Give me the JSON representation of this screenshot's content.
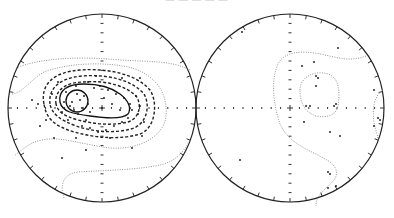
{
  "figure": {
    "caption_fragment": "— — — — —",
    "panels": [
      {
        "id": "left",
        "type": "equal-area stereonet",
        "center": [
          102,
          108
        ],
        "radius": 94,
        "contours": [
          {
            "style": "solid",
            "level": "highest"
          },
          {
            "style": "solid",
            "level": "high"
          },
          {
            "style": "dashed",
            "level": "mid-high"
          },
          {
            "style": "dashed",
            "level": "mid"
          },
          {
            "style": "dashed",
            "level": "mid-low"
          },
          {
            "style": "dotted",
            "level": "low"
          },
          {
            "style": "dotted",
            "level": "lowest"
          }
        ],
        "maximum_near": [
          77,
          101
        ]
      },
      {
        "id": "right",
        "type": "equal-area stereonet",
        "center": [
          290,
          108
        ],
        "radius": 94,
        "contours": [
          {
            "style": "dotted",
            "level": "low"
          },
          {
            "style": "dotted",
            "level": "lowest"
          }
        ],
        "maximum_near": [
          328,
          104
        ]
      }
    ]
  },
  "chart_data": [
    {
      "type": "scatter",
      "title": "",
      "subtype": "stereonet pole plot with density contours",
      "xlabel": "",
      "ylabel": "",
      "grid": false,
      "points_relative_to_center": [
        [
          -25,
          -14
        ],
        [
          -22,
          -8
        ],
        [
          -18,
          -12
        ],
        [
          -30,
          -6
        ],
        [
          -28,
          2
        ],
        [
          -20,
          0
        ],
        [
          -24,
          6
        ],
        [
          -14,
          -4
        ],
        [
          -12,
          4
        ],
        [
          -32,
          -2
        ],
        [
          -8,
          -20
        ],
        [
          -2,
          -22
        ],
        [
          6,
          -18
        ],
        [
          14,
          -14
        ],
        [
          22,
          -10
        ],
        [
          28,
          -4
        ],
        [
          30,
          2
        ],
        [
          26,
          10
        ],
        [
          20,
          14
        ],
        [
          12,
          18
        ],
        [
          4,
          22
        ],
        [
          -4,
          24
        ],
        [
          -12,
          20
        ],
        [
          -20,
          18
        ],
        [
          -34,
          12
        ],
        [
          -38,
          -6
        ],
        [
          -40,
          4
        ],
        [
          -36,
          -16
        ],
        [
          -26,
          -22
        ],
        [
          -14,
          -26
        ],
        [
          0,
          0
        ],
        [
          2,
          -10
        ],
        [
          10,
          -4
        ],
        [
          18,
          2
        ],
        [
          34,
          -12
        ],
        [
          36,
          6
        ],
        [
          38,
          -2
        ],
        [
          -50,
          -14
        ],
        [
          -64,
          -4
        ],
        [
          -56,
          12
        ],
        [
          -70,
          -8
        ],
        [
          -48,
          30
        ],
        [
          -16,
          42
        ],
        [
          -40,
          50
        ],
        [
          -26,
          30
        ],
        [
          40,
          28
        ],
        [
          30,
          40
        ],
        [
          38,
          -30
        ],
        [
          20,
          -30
        ],
        [
          -6,
          -32
        ],
        [
          -16,
          12
        ],
        [
          8,
          30
        ],
        [
          42,
          14
        ],
        [
          -44,
          -26
        ],
        [
          -62,
          18
        ]
      ],
      "right_points_relative_to_center": [
        [
          -48,
          -76
        ],
        [
          24,
          -46
        ],
        [
          48,
          -60
        ],
        [
          12,
          -42
        ],
        [
          26,
          -32
        ],
        [
          28,
          -30
        ],
        [
          26,
          -22
        ],
        [
          16,
          -2
        ],
        [
          20,
          -2
        ],
        [
          44,
          -2
        ],
        [
          46,
          -4
        ],
        [
          14,
          14
        ],
        [
          40,
          24
        ],
        [
          50,
          28
        ],
        [
          -50,
          52
        ],
        [
          38,
          64
        ],
        [
          40,
          66
        ],
        [
          38,
          80
        ],
        [
          46,
          78
        ],
        [
          84,
          -18
        ],
        [
          88,
          10
        ],
        [
          90,
          12
        ],
        [
          84,
          18
        ]
      ]
    }
  ]
}
